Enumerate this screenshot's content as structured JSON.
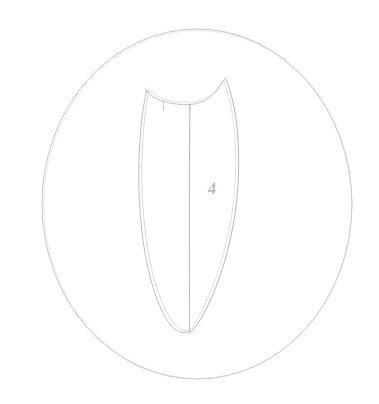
{
  "image": {
    "kind": "pencil-line-drawing",
    "title": "Faint pencil sketch of a pointed blade-shaped object inside a circle",
    "background_color": "#ffffff",
    "width": 379,
    "height": 404
  },
  "annotation": {
    "label": "4",
    "description": "handwritten numeral written on the right half of the blade",
    "x": 208,
    "y": 190,
    "color": "#9b9ba1"
  },
  "strokes": {
    "circle": {
      "name": "outer-circle",
      "color": "#c4c4c9",
      "width": 1,
      "center_x": 197,
      "center_y": 204,
      "radius_x": 155,
      "radius_y": 175
    },
    "blade_left_outer": {
      "name": "blade-left-outer-contour",
      "color": "#bdbdc3",
      "width": 1
    },
    "blade_left_inner": {
      "name": "blade-left-inner-contour",
      "color": "#c8c8cd",
      "width": 1
    },
    "blade_right_outer": {
      "name": "blade-right-outer-contour",
      "color": "#b6b6bc",
      "width": 1
    },
    "blade_right_inner": {
      "name": "blade-right-inner-contour",
      "color": "#c9c9ce",
      "width": 1
    },
    "blade_top_notch": {
      "name": "blade-top-notch-edge",
      "color": "#bcbcc2",
      "width": 1
    },
    "blade_top_notch_echo": {
      "name": "blade-top-notch-echo",
      "color": "#cdcdd2",
      "width": 1
    },
    "midrib": {
      "name": "blade-midrib-line",
      "color": "#b2b2b8",
      "width": 1,
      "top_x": 190,
      "top_y": 104,
      "bottom_x": 190,
      "bottom_y": 331
    },
    "tick_left": {
      "name": "notch-tick-left",
      "color": "#c2c2c8",
      "width": 1
    },
    "tick_right": {
      "name": "notch-tick-right",
      "color": "#c2c2c8",
      "width": 1
    },
    "tip": {
      "name": "blade-bottom-tip",
      "x": 190,
      "y": 332
    }
  }
}
